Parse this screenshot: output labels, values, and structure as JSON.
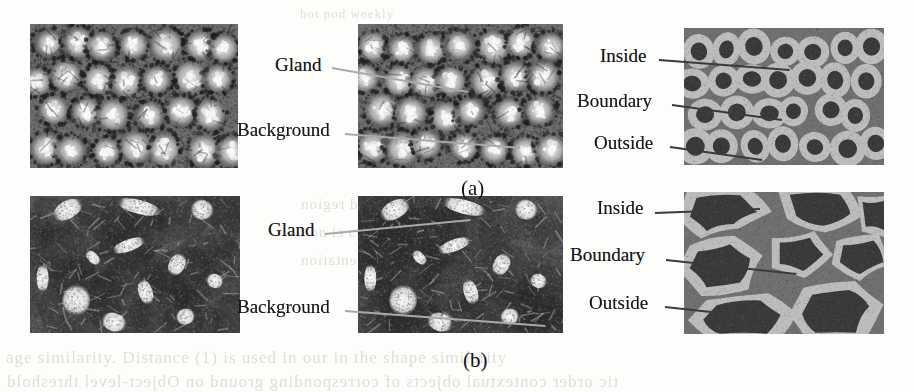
{
  "figure": {
    "width": 914,
    "height": 392,
    "background_color": "#fdfdfb",
    "page_labels": [
      {
        "name": "panel-a",
        "text": "(a)",
        "x": 461,
        "y": 178
      },
      {
        "name": "panel-b",
        "text": "(b)",
        "x": 463,
        "y": 350
      }
    ]
  },
  "colors": {
    "label_text": "#17161a",
    "leader_line": "#8a8a8a",
    "seg_inside": "#3a3a3a",
    "seg_boundary": "#bdbdbd",
    "seg_outside": "#707070",
    "bleed_text": "#dededa"
  },
  "rows": [
    {
      "id": "a",
      "caption": "(a)",
      "panels": [
        {
          "name": "original-histology-image-a",
          "kind": "histology",
          "variant": "glands-round",
          "x": 30,
          "y": 24,
          "w": 208,
          "h": 144
        },
        {
          "name": "annotated-histology-image-a",
          "kind": "histology",
          "variant": "glands-round",
          "x": 358,
          "y": 24,
          "w": 205,
          "h": 144
        },
        {
          "name": "segmentation-map-a",
          "kind": "segmentation",
          "variant": "rings",
          "x": 684,
          "y": 28,
          "w": 200,
          "h": 137
        }
      ],
      "annotations": [
        {
          "name": "label-gland-a",
          "text": "Gland",
          "x": 275,
          "y": 55,
          "anchor_x": 332,
          "anchor_y": 60,
          "tip_x": 468,
          "tip_y": 84,
          "tone": "pale"
        },
        {
          "name": "label-background-a",
          "text": "Background",
          "x": 237,
          "y": 120,
          "anchor_x": 345,
          "anchor_y": 126,
          "tip_x": 520,
          "tip_y": 140,
          "tone": "pale"
        },
        {
          "name": "label-inside-a",
          "text": "Inside",
          "x": 600,
          "y": 46,
          "anchor_x": 659,
          "anchor_y": 52,
          "tip_x": 790,
          "tip_y": 62,
          "tone": "dark"
        },
        {
          "name": "label-boundary-a",
          "text": "Boundary",
          "x": 577,
          "y": 91,
          "anchor_x": 672,
          "anchor_y": 97,
          "tip_x": 782,
          "tip_y": 112,
          "tone": "dark"
        },
        {
          "name": "label-outside-a",
          "text": "Outside",
          "x": 594,
          "y": 133,
          "anchor_x": 670,
          "anchor_y": 139,
          "tip_x": 762,
          "tip_y": 152,
          "tone": "dark"
        }
      ]
    },
    {
      "id": "b",
      "caption": "(b)",
      "panels": [
        {
          "name": "original-histology-image-b",
          "kind": "histology",
          "variant": "glands-irregular",
          "x": 30,
          "y": 196,
          "w": 210,
          "h": 137
        },
        {
          "name": "annotated-histology-image-b",
          "kind": "histology",
          "variant": "glands-irregular",
          "x": 358,
          "y": 196,
          "w": 205,
          "h": 137
        },
        {
          "name": "segmentation-map-b",
          "kind": "segmentation",
          "variant": "blobs",
          "x": 684,
          "y": 192,
          "w": 200,
          "h": 142
        }
      ],
      "annotations": [
        {
          "name": "label-gland-b",
          "text": "Gland",
          "x": 268,
          "y": 220,
          "anchor_x": 325,
          "anchor_y": 226,
          "tip_x": 470,
          "tip_y": 212,
          "tone": "pale"
        },
        {
          "name": "label-background-b",
          "text": "Background",
          "x": 237,
          "y": 297,
          "anchor_x": 345,
          "anchor_y": 303,
          "tip_x": 545,
          "tip_y": 318,
          "tone": "pale"
        },
        {
          "name": "label-inside-b",
          "text": "Inside",
          "x": 597,
          "y": 198,
          "anchor_x": 655,
          "anchor_y": 205,
          "tip_x": 760,
          "tip_y": 201,
          "tone": "dark"
        },
        {
          "name": "label-boundary-b",
          "text": "Boundary",
          "x": 570,
          "y": 245,
          "anchor_x": 666,
          "anchor_y": 252,
          "tip_x": 796,
          "tip_y": 266,
          "tone": "dark"
        },
        {
          "name": "label-outside-b",
          "text": "Outside",
          "x": 589,
          "y": 293,
          "anchor_x": 665,
          "anchor_y": 299,
          "tip_x": 748,
          "tip_y": 308,
          "tone": "dark"
        }
      ]
    }
  ],
  "bleed_through_text": [
    {
      "name": "bleed-top-1",
      "text": "hot pod  weekly",
      "x": 300,
      "y": 6,
      "size": 13
    },
    {
      "name": "bleed-mid-1",
      "text": "the  obtained  region",
      "x": 300,
      "y": 196,
      "size": 15
    },
    {
      "name": "bleed-mid-2",
      "text": "tion  is  considered",
      "x": 300,
      "y": 224,
      "size": 15
    },
    {
      "name": "bleed-mid-3",
      "text": "the  resulting  segmentation",
      "x": 300,
      "y": 252,
      "size": 15
    },
    {
      "name": "bleed-bottom-1",
      "text": "age similarity. Distance (1) is used in our in the shape similarity",
      "x": 6,
      "y": 348,
      "size": 17
    },
    {
      "name": "bleed-bottom-2",
      "text": "tic order contextual objects of corresponding ground on  Object-level threshold",
      "x": 6,
      "y": 372,
      "size": 17
    }
  ]
}
